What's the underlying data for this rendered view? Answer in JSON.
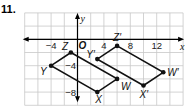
{
  "problem_number": "11.",
  "graph": {
    "origin_px": [
      77.5,
      39.3
    ],
    "unit_px": 6.6,
    "grid_step": 2,
    "x_range": [
      -8,
      16
    ],
    "y_range": [
      -10,
      4
    ],
    "x_axis_label": "x",
    "y_axis_label": "y",
    "origin_label": "O",
    "x_tick_labels": [
      {
        "value": -4,
        "text": "−4"
      },
      {
        "value": 4,
        "text": "4"
      },
      {
        "value": 8,
        "text": "8"
      },
      {
        "value": 12,
        "text": "12"
      }
    ],
    "y_tick_labels": [
      {
        "value": -4,
        "text": "−4"
      },
      {
        "value": -8,
        "text": "−8"
      }
    ],
    "colors": {
      "grid": "#c8c8c8",
      "axis": "#000000",
      "figure": "#111111"
    },
    "figures": [
      {
        "name": "original",
        "vertices": [
          {
            "label": "Z",
            "x": -1,
            "y": -2,
            "label_dx": -9,
            "label_dy": -3
          },
          {
            "label": "W",
            "x": 6,
            "y": -6,
            "label_dx": 4,
            "label_dy": 11
          },
          {
            "label": "X",
            "x": 3,
            "y": -8,
            "label_dx": -2,
            "label_dy": 11
          },
          {
            "label": "Y",
            "x": -4,
            "y": -4,
            "label_dx": -11,
            "label_dy": 9
          }
        ]
      },
      {
        "name": "image",
        "vertices": [
          {
            "label": "Z′",
            "x": 6,
            "y": -1,
            "label_dx": -4,
            "label_dy": -5
          },
          {
            "label": "W′",
            "x": 13,
            "y": -5,
            "label_dx": 4,
            "label_dy": 4
          },
          {
            "label": "X′",
            "x": 10,
            "y": -7,
            "label_dx": -4,
            "label_dy": 12
          },
          {
            "label": "Y′",
            "x": 3,
            "y": -3,
            "label_dx": -11,
            "label_dy": -1
          }
        ]
      }
    ]
  }
}
